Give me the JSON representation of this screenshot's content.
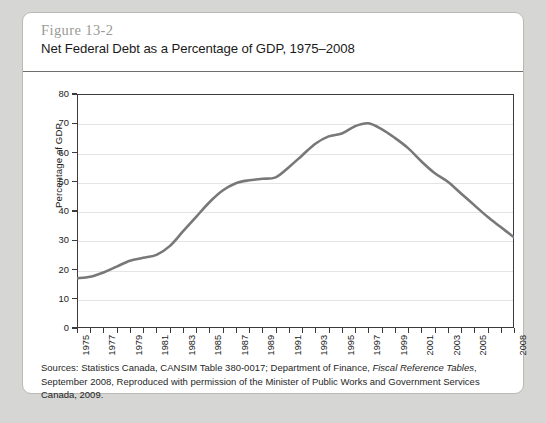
{
  "figure": {
    "number": "Figure 13-2",
    "title": "Net Federal Debt as a Percentage of GDP, 1975–2008"
  },
  "source": {
    "line1_pre": "Sources: Statistics Canada, CANSIM Table 380-0017; Department of Finance, ",
    "line1_italic": "Fiscal Reference Tables",
    "line1_post": ", September",
    "line2": "2008, Reproduced with permission of the Minister of Public Works and Government Services Canada, 2009."
  },
  "colors": {
    "line": "#78787a",
    "frame": "#3b3b3b",
    "grid": "#e4e4e4",
    "card_border": "#b9b9b6",
    "page_background": "#d6d6d4",
    "figure_number": "#9a9a96"
  },
  "chart_data": {
    "type": "line",
    "title": "Net Federal Debt as a Percentage of GDP, 1975–2008",
    "xlabel": "",
    "ylabel": "Percentage of GDP",
    "xlim": [
      1975,
      2008
    ],
    "ylim": [
      0,
      80
    ],
    "ytick_values": [
      0,
      10,
      20,
      30,
      40,
      50,
      60,
      70,
      80
    ],
    "ytick_labels": [
      "0",
      "10",
      "20",
      "30",
      "40",
      "50",
      "60",
      "70",
      "80"
    ],
    "xtick_labels": [
      "1975",
      "1977",
      "1979",
      "1981",
      "1983",
      "1985",
      "1987",
      "1989",
      "1991",
      "1993",
      "1995",
      "1997",
      "1999",
      "2001",
      "2003",
      "2005",
      "2008"
    ],
    "xtick_label_years": [
      1975,
      1977,
      1979,
      1981,
      1983,
      1985,
      1987,
      1989,
      1991,
      1993,
      1995,
      1997,
      1999,
      2001,
      2003,
      2005,
      2008
    ],
    "grid": "horizontal",
    "legend": "none",
    "series": [
      {
        "name": "Net federal debt as a percentage of GDP",
        "x": [
          1975,
          1976,
          1977,
          1978,
          1979,
          1980,
          1981,
          1982,
          1983,
          1984,
          1985,
          1986,
          1987,
          1988,
          1989,
          1990,
          1991,
          1992,
          1993,
          1994,
          1995,
          1996,
          1997,
          1998,
          1999,
          2000,
          2001,
          2002,
          2003,
          2004,
          2005,
          2006,
          2007,
          2008
        ],
        "values": [
          17,
          17.5,
          19,
          21,
          23,
          24,
          25,
          28,
          33,
          38,
          43,
          47,
          49.5,
          50.5,
          51,
          51.5,
          55,
          59,
          63,
          65.5,
          66.5,
          69,
          70,
          68,
          65,
          61.5,
          57,
          53,
          50,
          46,
          42,
          38,
          34.5,
          31
        ]
      }
    ]
  }
}
